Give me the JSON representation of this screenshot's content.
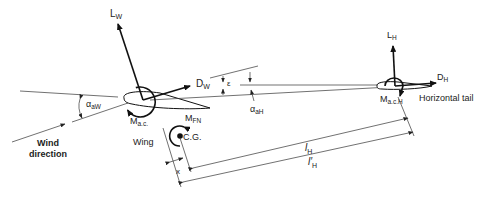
{
  "diagram": {
    "labels": {
      "lift_wing": {
        "main": "L",
        "sub": "W"
      },
      "drag_wing": {
        "main": "D",
        "sub": "W"
      },
      "lift_tail": {
        "main": "L",
        "sub": "H"
      },
      "drag_tail": {
        "main": "D",
        "sub": "H"
      },
      "alpha_wing": {
        "main": "α",
        "sub": "aW"
      },
      "alpha_tail": {
        "main": "α",
        "sub": "aH"
      },
      "epsilon": "ε",
      "moment_ac_wing": {
        "main": "M",
        "sub": "a.c."
      },
      "moment_fuselage": {
        "main": "M",
        "sub": "FN"
      },
      "moment_ac_tail": {
        "main": "M",
        "sub": "a.c.H"
      },
      "cg": "C.G.",
      "wing": "Wing",
      "horizontal_tail": "Horizontal tail",
      "wind_direction_line1": "Wind",
      "wind_direction_line2": "direction",
      "x_distance": "x",
      "l_h": {
        "main": "l",
        "sub": "H"
      },
      "l_h_prime": {
        "main": "l′",
        "sub": "H"
      }
    }
  }
}
